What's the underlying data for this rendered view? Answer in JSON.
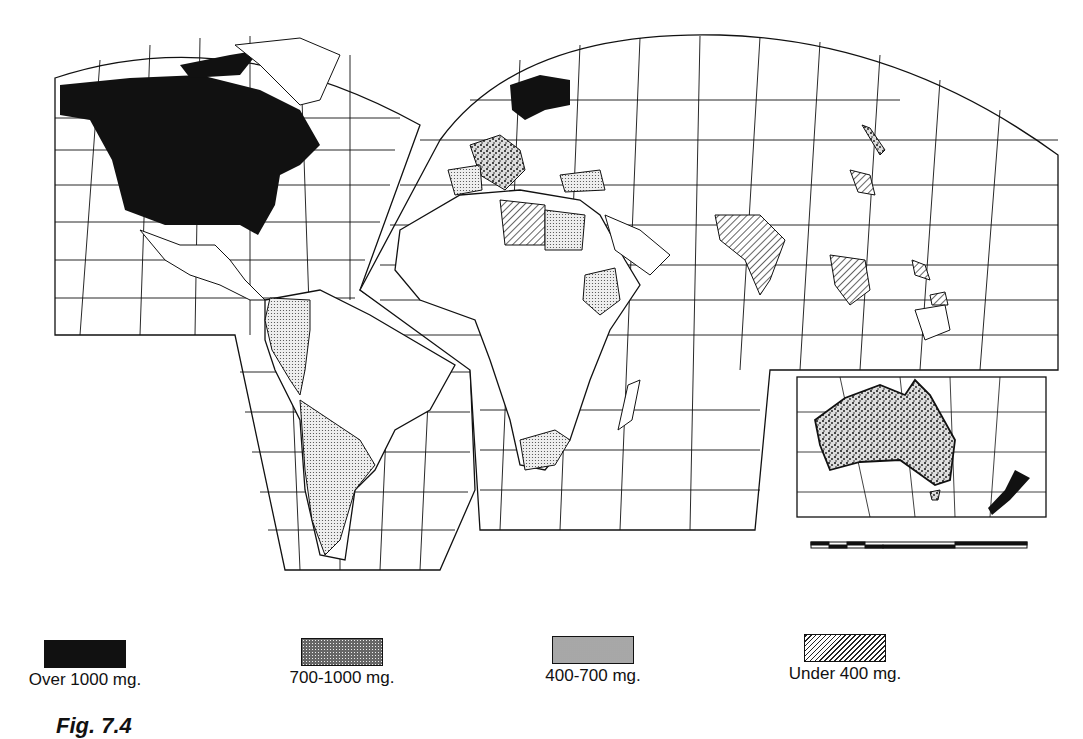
{
  "figure": {
    "caption": "Fig. 7.4",
    "type": "choropleth world map (interrupted projection)"
  },
  "legend": {
    "items": [
      {
        "label": "Over 1000 mg.",
        "pattern": "solid-black",
        "color": "#111111"
      },
      {
        "label": "700-1000 mg.",
        "pattern": "coarse-stipple",
        "color": "#555555"
      },
      {
        "label": "400-700 mg.",
        "pattern": "fine-stipple",
        "color": "#bbbbbb"
      },
      {
        "label": "Under 400 mg.",
        "pattern": "diagonal-hatch",
        "color": "#777777"
      }
    ]
  },
  "map": {
    "regions": [
      {
        "name": "North America (Canada, USA)",
        "class": "Over 1000 mg."
      },
      {
        "name": "Scandinavia",
        "class": "Over 1000 mg."
      },
      {
        "name": "New Zealand",
        "class": "Over 1000 mg."
      },
      {
        "name": "Australia",
        "class": "700-1000 mg."
      },
      {
        "name": "Western/Central Europe",
        "class": "700-1000 mg."
      },
      {
        "name": "Japan (part)",
        "class": "700-1000 mg."
      },
      {
        "name": "Iberia",
        "class": "400-700 mg."
      },
      {
        "name": "Turkey",
        "class": "400-700 mg."
      },
      {
        "name": "Egypt",
        "class": "400-700 mg."
      },
      {
        "name": "Ethiopia",
        "class": "400-700 mg."
      },
      {
        "name": "South Africa",
        "class": "400-700 mg."
      },
      {
        "name": "Western South America",
        "class": "400-700 mg."
      },
      {
        "name": "Argentina / Chile",
        "class": "400-700 mg."
      },
      {
        "name": "Libya",
        "class": "Under 400 mg."
      },
      {
        "name": "India",
        "class": "Under 400 mg."
      },
      {
        "name": "Southeast Asia (Thailand/Indochina)",
        "class": "Under 400 mg."
      },
      {
        "name": "Philippines",
        "class": "Under 400 mg."
      },
      {
        "name": "Korea",
        "class": "Under 400 mg."
      }
    ],
    "scale_bar": {
      "segments": 6
    }
  }
}
